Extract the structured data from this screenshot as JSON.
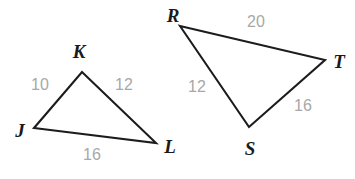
{
  "figure": {
    "kind": "two-triangles-geometry-diagram",
    "canvas": {
      "width": 355,
      "height": 179,
      "background": "#ffffff"
    },
    "styles": {
      "edge_color": "#1c1c1c",
      "vertex_label_color": "#1a1a1a",
      "side_label_color": "#a8a8a8",
      "edge_width": 2.1
    },
    "triangles": [
      {
        "id": "JKL",
        "name": "triangle-jkl",
        "vertices": [
          {
            "label": "J",
            "name": "vertex-j",
            "x": 34,
            "y": 128,
            "label_x": 20,
            "label_y": 130
          },
          {
            "label": "K",
            "name": "vertex-k",
            "x": 82,
            "y": 72,
            "label_x": 79,
            "label_y": 51
          },
          {
            "label": "L",
            "name": "vertex-l",
            "x": 156,
            "y": 143,
            "label_x": 170,
            "label_y": 146
          }
        ],
        "sides": [
          {
            "label": "10",
            "name": "side-label-jk",
            "x": 40,
            "y": 85
          },
          {
            "label": "12",
            "name": "side-label-kl",
            "x": 124,
            "y": 85
          },
          {
            "label": "16",
            "name": "side-label-jl",
            "x": 92,
            "y": 155
          }
        ]
      },
      {
        "id": "RST",
        "name": "triangle-rst",
        "vertices": [
          {
            "label": "R",
            "name": "vertex-r",
            "x": 180,
            "y": 26,
            "label_x": 173,
            "label_y": 15
          },
          {
            "label": "T",
            "name": "vertex-t",
            "x": 325,
            "y": 60,
            "label_x": 339,
            "label_y": 61
          },
          {
            "label": "S",
            "name": "vertex-s",
            "x": 249,
            "y": 127,
            "label_x": 250,
            "label_y": 148
          }
        ],
        "sides": [
          {
            "label": "20",
            "name": "side-label-rt",
            "x": 256,
            "y": 22
          },
          {
            "label": "12",
            "name": "side-label-rs",
            "x": 197,
            "y": 87
          },
          {
            "label": "16",
            "name": "side-label-st",
            "x": 303,
            "y": 106
          }
        ]
      }
    ]
  }
}
